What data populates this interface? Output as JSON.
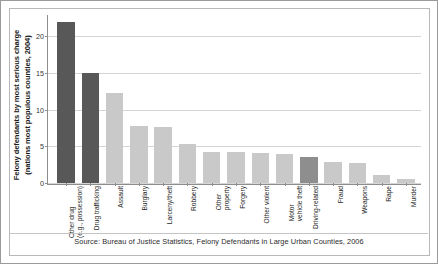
{
  "chart_data": {
    "type": "bar",
    "title": "",
    "ylabel": "Felony defendants by most serious charge (nations most populous counties, 2004)",
    "ylabel_line1": "Felony defendants by most serious charge",
    "ylabel_line2": "(nations most populous counties, 2004)",
    "xlabel": "",
    "ylim": [
      0,
      23
    ],
    "yticks": [
      0,
      5,
      10,
      15,
      20
    ],
    "ytick_labels": [
      "0",
      "5",
      "10",
      "15",
      "20"
    ],
    "grid": true,
    "legend": "none",
    "categories": [
      "Other drug (e.g., possession)",
      "Drug trafficking",
      "Assault",
      "Burglary",
      "Larceny/theft",
      "Robbery",
      "Other property",
      "Forgery",
      "Other violent",
      "Motor vehicle theft",
      "Driving-related",
      "Fraud",
      "Weapons",
      "Rape",
      "Murder"
    ],
    "category_lines": [
      [
        "Other drug",
        "(e.g., possession)"
      ],
      [
        "Drug trafficking"
      ],
      [
        "Assault"
      ],
      [
        "Burglary"
      ],
      [
        "Larceny/theft"
      ],
      [
        "Robbery"
      ],
      [
        "Other",
        "property"
      ],
      [
        "Forgery"
      ],
      [
        "Other violent"
      ],
      [
        "Motor",
        "vehicle theft"
      ],
      [
        "Driving-related"
      ],
      [
        "Fraud"
      ],
      [
        "Weapons"
      ],
      [
        "Rape"
      ],
      [
        "Murder"
      ]
    ],
    "values": [
      22.0,
      15.0,
      12.3,
      7.8,
      7.7,
      5.3,
      4.3,
      4.2,
      4.1,
      4.0,
      3.5,
      2.9,
      2.7,
      1.1,
      0.6
    ],
    "bar_shades": [
      "dark",
      "dark",
      "light",
      "light",
      "light",
      "light",
      "light",
      "light",
      "light",
      "light",
      "mid",
      "light",
      "light",
      "light",
      "light"
    ]
  },
  "colors": {
    "bar_dark": "#585858",
    "bar_mid": "#8e8e8e",
    "bar_light": "#c9c9c9",
    "axis": "#8d8d8d",
    "grid": "#d5d5d5",
    "frame": "#b8b8b8",
    "text": "#1f1f1f"
  },
  "source": {
    "text": "Source: Bureau of Justice Statistics, Felony Defendants in Large Urban Counties, 2006"
  }
}
